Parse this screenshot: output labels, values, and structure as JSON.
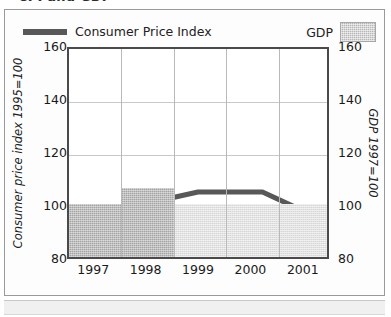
{
  "title": "CPI and GDP",
  "legend": [
    {
      "label": "Consumer Price Index",
      "type": "line",
      "color": "#585858"
    },
    {
      "label": "GDP",
      "type": "bar",
      "color": "#b6b6b6"
    }
  ],
  "axes": {
    "left_title": "Consumer price index 1995=100",
    "right_title": "GDP 1997=100",
    "ticks": [
      "160",
      "140",
      "120",
      "100",
      "80"
    ]
  },
  "chart_data": {
    "type": "bar",
    "title": "CPI and GDP",
    "xlabel": "",
    "ylabel": "Consumer price index 1995=100",
    "y2label": "GDP 1997=100",
    "categories": [
      "1997",
      "1998",
      "1999",
      "2000",
      "2001"
    ],
    "ylim": [
      80,
      160
    ],
    "y2lim": [
      80,
      160
    ],
    "yticks": [
      80,
      100,
      120,
      140,
      160
    ],
    "grid": true,
    "legend_position": "top",
    "series": [
      {
        "name": "GDP",
        "type": "bar",
        "axis": "right",
        "values": [
          100,
          106,
          100,
          100,
          100
        ],
        "colors": [
          "#a3a3a3",
          "#a3a3a3",
          "#e2e2e2",
          "#e2e2e2",
          "#e2e2e2"
        ]
      },
      {
        "name": "Consumer Price Index",
        "type": "line",
        "axis": "left",
        "color": "#585858",
        "x": [
          "1997",
          "1998",
          "1999",
          "2000",
          "2001"
        ],
        "values": [
          97,
          99.5,
          105,
          105,
          93.5
        ]
      }
    ]
  }
}
